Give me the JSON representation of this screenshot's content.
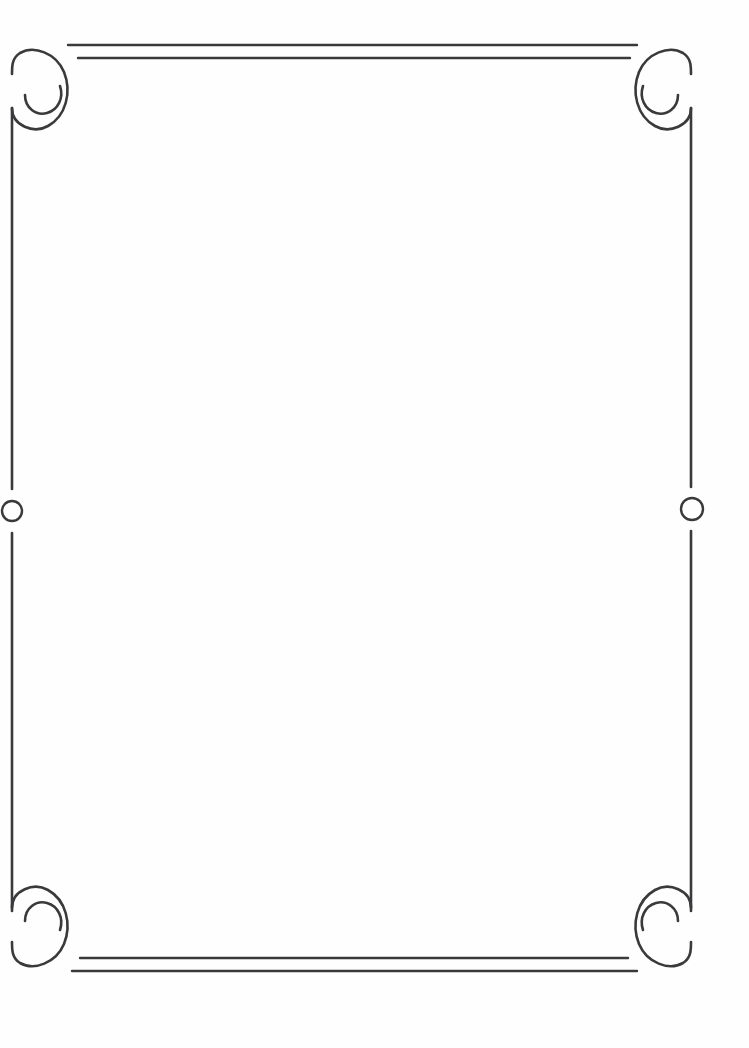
{
  "document": {
    "title": "Decorative Ornamental Frame",
    "kind": "line-art border",
    "width": 749,
    "height": 1048,
    "background_color": "#fefefe",
    "content_area": "blank"
  },
  "style": {
    "stroke_color": "#3a3a3c",
    "stroke_width_border": 2.6,
    "stroke_width_rule": 2.4,
    "stroke_width_circle": 2.4,
    "stroke_width_spiral": 2.6
  },
  "frame": {
    "left_x": 12,
    "right_x": 691,
    "top_y": 57,
    "bottom_y": 959,
    "corner_radius": 30
  },
  "ornaments": {
    "spirals": [
      {
        "name": "top-left-spiral",
        "cx": 41,
        "cy": 79,
        "rotation": 0
      },
      {
        "name": "top-right-spiral",
        "cx": 662,
        "cy": 79,
        "rotation": 90
      },
      {
        "name": "bottom-right-spiral",
        "cx": 662,
        "cy": 937,
        "rotation": 180
      },
      {
        "name": "bottom-left-spiral",
        "cx": 41,
        "cy": 937,
        "rotation": 270
      }
    ],
    "rules": [
      {
        "name": "top-outer-rule",
        "x1": 68,
        "x2": 637,
        "y": 45
      },
      {
        "name": "top-inner-rule",
        "x1": 78,
        "x2": 630,
        "y": 58
      },
      {
        "name": "bottom-inner-rule",
        "x1": 80,
        "x2": 628,
        "y": 958
      },
      {
        "name": "bottom-outer-rule",
        "x1": 72,
        "x2": 637,
        "y": 971
      }
    ],
    "circles": [
      {
        "name": "left-edge-circle",
        "cx": 12,
        "cy": 511,
        "r": 10,
        "gap_top": 489,
        "gap_bottom": 533
      },
      {
        "name": "right-edge-circle",
        "cx": 692,
        "cy": 509,
        "r": 11,
        "gap_top": 487,
        "gap_bottom": 531
      }
    ]
  }
}
